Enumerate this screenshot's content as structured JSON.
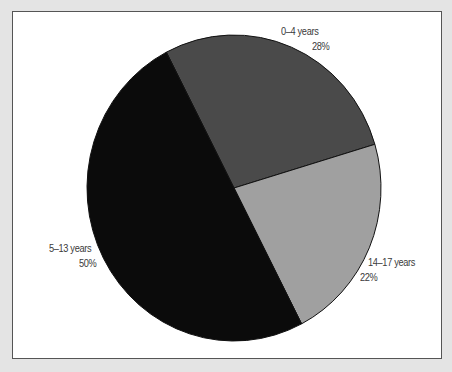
{
  "chart_data": {
    "type": "pie",
    "title": "",
    "categories": [
      "0–4 years",
      "14–17 years",
      "5–13 years"
    ],
    "values": [
      28,
      22,
      50
    ],
    "unit": "%",
    "labels": [
      {
        "name": "0–4 years",
        "percent": "28%"
      },
      {
        "name": "14–17 years",
        "percent": "22%"
      },
      {
        "name": "5–13 years",
        "percent": "50%"
      }
    ],
    "colors": [
      "#4a4a4a",
      "#a0a0a0",
      "#0b0b0b"
    ],
    "start_angle_deg": -27.4,
    "direction": "clockwise",
    "legend": "none (direct labels)"
  },
  "page": {
    "background": "#e4e4e4",
    "frame_background": "#ffffff",
    "frame_border": "#555555"
  }
}
